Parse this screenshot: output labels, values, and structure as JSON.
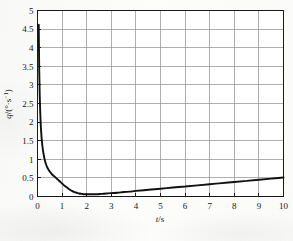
{
  "figure": {
    "background_color": "#fbfbfa",
    "plot_background_color": "#ffffff",
    "frame_color": "#1a1a1a",
    "grid_color": "#8d8d8d",
    "curve_color": "#111111"
  },
  "axes": {
    "x": {
      "title_symbol": "t",
      "title_separator": "/",
      "title_unit": "s",
      "title_full": "t/s",
      "ticks": [
        "0",
        "1",
        "2",
        "3",
        "4",
        "5",
        "6",
        "7",
        "8",
        "9",
        "10"
      ],
      "min": 0,
      "max": 10,
      "tick_step": 1
    },
    "y": {
      "title_symbol": "q",
      "title_separator": "/(",
      "title_unit_degree": "°",
      "title_unit_dot": "·",
      "title_unit_s": "s",
      "title_unit_exponent": "−1",
      "title_unit_close": ")",
      "title_full": "q/(°·s⁻¹)",
      "ticks": [
        "0",
        "0.5",
        "1",
        "1.5",
        "2",
        "2.5",
        "3",
        "3.5",
        "4",
        "4.5",
        "5"
      ],
      "min": 0,
      "max": 5,
      "tick_step": 0.5
    }
  },
  "chart_data": {
    "type": "line",
    "title": "",
    "subtitle": "",
    "xlabel": "t/s",
    "ylabel": "q/(°·s⁻¹)",
    "xlim": [
      0,
      10
    ],
    "ylim": [
      0,
      5
    ],
    "grid": true,
    "legend": false,
    "legend_position": "none",
    "xticks": [
      0,
      1,
      2,
      3,
      4,
      5,
      6,
      7,
      8,
      9,
      10
    ],
    "yticks": [
      0,
      0.5,
      1,
      1.5,
      2,
      2.5,
      3,
      3.5,
      4,
      4.5,
      5
    ],
    "annotations": [],
    "series": [
      {
        "name": "q(t)",
        "color": "#111111",
        "line_width": 1.9,
        "x": [
          0.05,
          0.07,
          0.09,
          0.11,
          0.13,
          0.15,
          0.18,
          0.21,
          0.25,
          0.3,
          0.35,
          0.4,
          0.45,
          0.5,
          0.55,
          0.6,
          0.65,
          0.7,
          0.75,
          0.8,
          0.85,
          0.9,
          0.95,
          1.0,
          1.1,
          1.2,
          1.3,
          1.4,
          1.5,
          1.6,
          1.7,
          1.8,
          1.9,
          2.0,
          2.2,
          2.4,
          2.6,
          2.8,
          3.0,
          3.25,
          3.5,
          3.75,
          4.0,
          4.5,
          5.0,
          5.5,
          6.0,
          6.5,
          7.0,
          7.5,
          8.0,
          8.5,
          9.0,
          9.5,
          10.0
        ],
        "y": [
          4.62,
          3.41,
          2.73,
          2.28,
          1.96,
          1.73,
          1.48,
          1.3,
          1.13,
          0.97,
          0.86,
          0.78,
          0.72,
          0.67,
          0.63,
          0.59,
          0.56,
          0.53,
          0.5,
          0.47,
          0.44,
          0.41,
          0.38,
          0.35,
          0.29,
          0.24,
          0.19,
          0.15,
          0.12,
          0.1,
          0.08,
          0.07,
          0.06,
          0.06,
          0.06,
          0.06,
          0.07,
          0.08,
          0.09,
          0.1,
          0.12,
          0.13,
          0.15,
          0.18,
          0.21,
          0.24,
          0.27,
          0.3,
          0.33,
          0.36,
          0.39,
          0.42,
          0.45,
          0.48,
          0.51
        ]
      }
    ]
  }
}
